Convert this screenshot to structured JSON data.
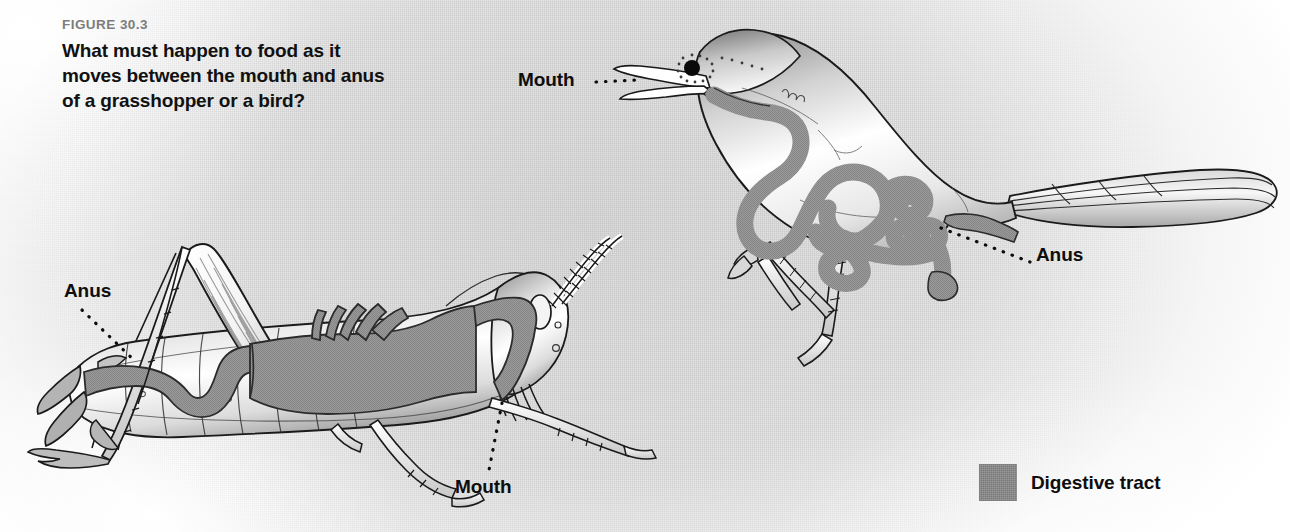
{
  "figure": {
    "number": "FIGURE 30.3",
    "question": "What must happen to food as it moves between the mouth and anus of a grasshopper or a bird?"
  },
  "colors": {
    "digestive_tract": "#9a9a9a",
    "tract_outline": "#2b2b2b",
    "body_outline": "#1a1a1a",
    "figure_number_text": "#7d7d7d",
    "caption_text": "#111111",
    "background_wash": "#e4e4e4",
    "page_background": "#ffffff"
  },
  "legend": {
    "items": [
      {
        "label": "Digestive tract",
        "swatch_color": "#9a9a9a"
      }
    ]
  },
  "organisms": [
    {
      "id": "grasshopper",
      "name": "Grasshopper",
      "callouts": [
        {
          "id": "hopper-anus",
          "label": "Anus",
          "leader": "dotted"
        },
        {
          "id": "hopper-mouth",
          "label": "Mouth",
          "leader": "dotted"
        }
      ]
    },
    {
      "id": "bird",
      "name": "Bird",
      "callouts": [
        {
          "id": "bird-mouth",
          "label": "Mouth",
          "leader": "dotted"
        },
        {
          "id": "bird-anus",
          "label": "Anus",
          "leader": "dotted"
        }
      ]
    }
  ]
}
